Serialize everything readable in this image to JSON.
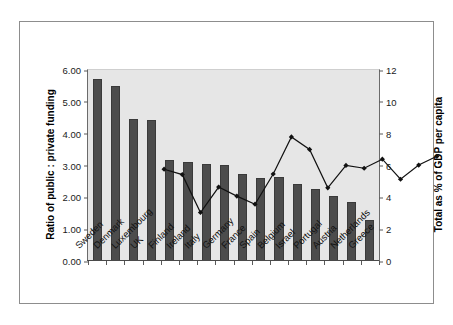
{
  "chart_data": {
    "type": "bar",
    "title": "",
    "categories": [
      "Sweden",
      "Denmark",
      "Luxembourg",
      "UK",
      "Finland",
      "Ireland",
      "Italy",
      "Germany",
      "France",
      "Spain",
      "Belgium",
      "Israel",
      "Portugal",
      "Austria",
      "Netherlands",
      "Greece"
    ],
    "series": [
      {
        "name": "Ratio of public : private funding",
        "type": "bar",
        "axis": "left",
        "values": [
          5.72,
          5.5,
          4.46,
          4.44,
          3.17,
          3.11,
          3.04,
          3.02,
          2.73,
          2.62,
          2.63,
          2.41,
          2.25,
          2.04,
          1.86,
          1.3
        ],
        "color": "#4c4c4c"
      },
      {
        "name": "Total as % of GDP per capita",
        "type": "line",
        "axis": "right",
        "values": [
          8.72,
          8.38,
          6.0,
          7.6,
          7.03,
          6.52,
          8.42,
          10.75,
          9.96,
          7.55,
          8.96,
          8.78,
          9.35,
          8.09,
          8.98,
          9.53
        ],
        "color": "#111111",
        "marker": "diamond"
      }
    ],
    "xlabel": "",
    "ylabel": "Ratio of public : private funding",
    "y2label": "Total as % of GDP per capita",
    "ylim": [
      0,
      6
    ],
    "y2lim": [
      0,
      12
    ],
    "yticks": [
      "0.00",
      "1.00",
      "2.00",
      "3.00",
      "4.00",
      "5.00",
      "6.00"
    ],
    "ytick_values": [
      0,
      1,
      2,
      3,
      4,
      5,
      6
    ],
    "y2ticks": [
      "0",
      "2",
      "4",
      "6",
      "8",
      "10",
      "12"
    ],
    "y2tick_values": [
      0,
      2,
      4,
      6,
      8,
      10,
      12
    ],
    "grid": false,
    "legend": "none",
    "plot_background": "#e6e6e6",
    "figure_background": "#ffffff",
    "border_color": "#8d8d8d"
  }
}
